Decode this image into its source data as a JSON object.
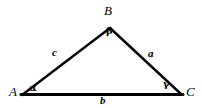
{
  "figure": {
    "type": "geometry-diagram",
    "shape": "triangle",
    "background_color": "#ffffff",
    "stroke_color": "#000000",
    "vertices": [
      {
        "id": "A",
        "label": "A",
        "x": 22,
        "y": 95
      },
      {
        "id": "B",
        "label": "B",
        "x": 110,
        "y": 28
      },
      {
        "id": "C",
        "label": "C",
        "x": 181,
        "y": 94
      }
    ],
    "sides": [
      {
        "id": "a",
        "label": "a",
        "between": "B-C",
        "label_x": 152,
        "label_y": 54
      },
      {
        "id": "b",
        "label": "b",
        "between": "A-C",
        "label_x": 104,
        "label_y": 100
      },
      {
        "id": "c",
        "label": "c",
        "between": "A-B",
        "label_x": 56,
        "label_y": 53
      }
    ],
    "angles": [
      {
        "at": "A",
        "label": "α",
        "label_x": 33,
        "label_y": 88
      },
      {
        "at": "B",
        "label": "β",
        "label_x": 110,
        "label_y": 32
      },
      {
        "at": "C",
        "label": "γ",
        "label_x": 167,
        "label_y": 85
      }
    ],
    "strokes": {
      "base_width": 3,
      "leg_width": 2.4
    }
  }
}
